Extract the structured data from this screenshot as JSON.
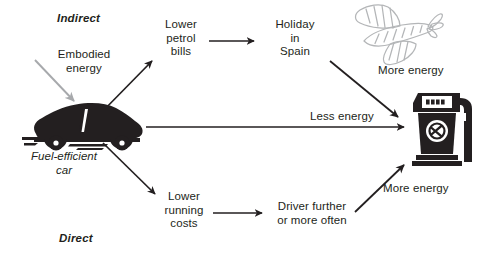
{
  "diagram": {
    "type": "flow-diagram",
    "sections": {
      "indirect": "Indirect",
      "direct": "Direct"
    },
    "nodes": {
      "embodied_energy": "Embodied\nenergy",
      "car": "Fuel-efficient\ncar",
      "lower_petrol_bills": "Lower\npetrol\nbills",
      "holiday_in_spain": "Holiday\nin\nSpain",
      "lower_running_costs": "Lower\nrunning\ncosts",
      "driver_further": "Driver further\nor more often"
    },
    "edge_labels": {
      "more_energy_top": "More energy",
      "less_energy_middle": "Less energy",
      "more_energy_bottom": "More energy"
    },
    "icons": {
      "car": "car-icon",
      "airplane": "airplane-icon",
      "fuel_pump": "fuel-pump-icon"
    },
    "colors": {
      "ink": "#231f20",
      "gray_arrow": "#a7a9ac",
      "airplane_line": "#b4b6b8",
      "background": "#ffffff"
    }
  }
}
